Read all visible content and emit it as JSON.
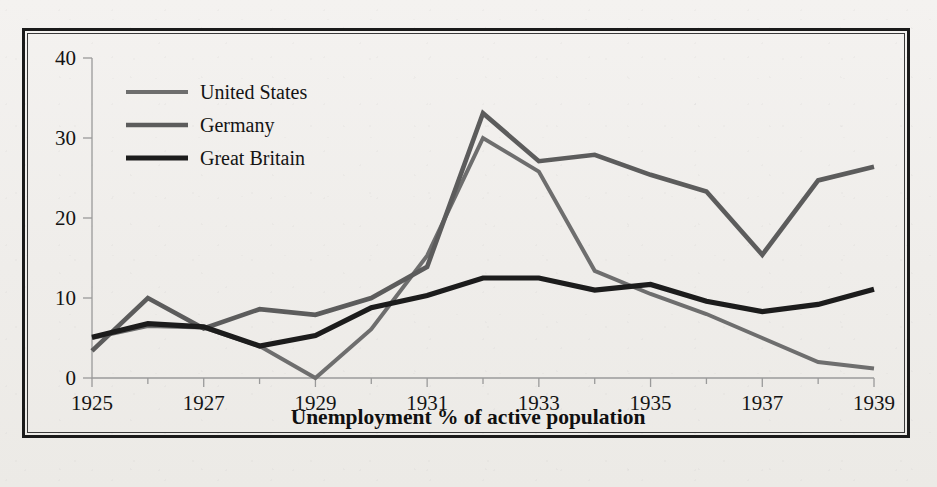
{
  "figure": {
    "caption": "Unemployment % of active population",
    "frame_color": "#1a1a1a",
    "background_color": "#f2f0ee"
  },
  "legend": {
    "position": "top-left-inside",
    "entries": [
      {
        "label": "United States",
        "color": "#6e6e6e",
        "width": 4.0
      },
      {
        "label": "Germany",
        "color": "#5c5c5c",
        "width": 4.6
      },
      {
        "label": "Great Britain",
        "color": "#1c1c1c",
        "width": 5.2
      }
    ]
  },
  "axes": {
    "y_ticks": [
      "0",
      "10",
      "20",
      "30",
      "40"
    ],
    "x_ticks": [
      "1925",
      "1927",
      "1929",
      "1931",
      "1933",
      "1935",
      "1937",
      "1939"
    ]
  },
  "chart_data": {
    "type": "line",
    "title": "",
    "subtitle": "",
    "xlabel": "Unemployment % of active population",
    "ylabel": "",
    "xlim": [
      1925,
      1939
    ],
    "ylim": [
      0,
      40
    ],
    "yticks": [
      0,
      10,
      20,
      30,
      40
    ],
    "xticks": [
      1925,
      1927,
      1929,
      1931,
      1933,
      1935,
      1937,
      1939
    ],
    "xticks_minor": [
      1926,
      1928,
      1930,
      1932,
      1934,
      1936,
      1938
    ],
    "grid": false,
    "legend_position": "upper left",
    "x": [
      1925,
      1926,
      1927,
      1928,
      1929,
      1930,
      1931,
      1932,
      1933,
      1934,
      1935,
      1936,
      1937,
      1938,
      1939
    ],
    "series": [
      {
        "name": "United States",
        "color": "#6e6e6e",
        "values": [
          3.2,
          1.8,
          3.3,
          4.2,
          3.2,
          8.7,
          15.9,
          23.6,
          24.9,
          21.7,
          20.1,
          16.9,
          14.3,
          19.0,
          17.2
        ]
      },
      {
        "name": "Germany",
        "color": "#5c5c5c",
        "values": [
          6.7,
          18.0,
          8.8,
          8.4,
          13.1,
          15.3,
          23.3,
          30.1,
          26.3,
          14.9,
          11.6,
          8.3,
          4.6,
          2.1,
          0.9
        ]
      },
      {
        "name": "Great Britain",
        "color": "#1c1c1c",
        "values": [
          11.3,
          12.5,
          9.7,
          10.8,
          10.4,
          16.1,
          21.3,
          22.1,
          19.9,
          16.7,
          15.5,
          13.1,
          10.8,
          12.9,
          11.0
        ]
      }
    ],
    "plotted_points": {
      "United States": [
        [
          1925,
          5.0
        ],
        [
          1926,
          6.5
        ],
        [
          1927,
          6.3
        ],
        [
          1928,
          4.0
        ],
        [
          1929,
          0.0
        ],
        [
          1930,
          6.1
        ],
        [
          1931,
          15.3
        ],
        [
          1932,
          30.0
        ],
        [
          1933,
          25.8
        ],
        [
          1934,
          13.4
        ],
        [
          1935,
          10.5
        ],
        [
          1936,
          8.0
        ],
        [
          1937,
          5.0
        ],
        [
          1938,
          2.0
        ],
        [
          1939,
          1.2
        ]
      ],
      "Germany": [
        [
          1925,
          3.4
        ],
        [
          1926,
          10.0
        ],
        [
          1927,
          6.2
        ],
        [
          1928,
          8.6
        ],
        [
          1929,
          7.9
        ],
        [
          1930,
          10.0
        ],
        [
          1931,
          13.9
        ],
        [
          1932,
          33.1
        ],
        [
          1933,
          27.1
        ],
        [
          1934,
          27.9
        ],
        [
          1935,
          25.4
        ],
        [
          1936,
          23.3
        ],
        [
          1937,
          15.4
        ],
        [
          1938,
          24.7
        ],
        [
          1939,
          26.4
        ]
      ],
      "Great Britain": [
        [
          1925,
          5.1
        ],
        [
          1926,
          6.8
        ],
        [
          1927,
          6.4
        ],
        [
          1928,
          4.0
        ],
        [
          1929,
          5.3
        ],
        [
          1930,
          8.8
        ],
        [
          1931,
          10.3
        ],
        [
          1932,
          12.5
        ],
        [
          1933,
          12.5
        ],
        [
          1934,
          11.0
        ],
        [
          1935,
          11.7
        ],
        [
          1936,
          9.6
        ],
        [
          1937,
          8.3
        ],
        [
          1938,
          9.2
        ],
        [
          1939,
          11.1
        ]
      ]
    }
  }
}
